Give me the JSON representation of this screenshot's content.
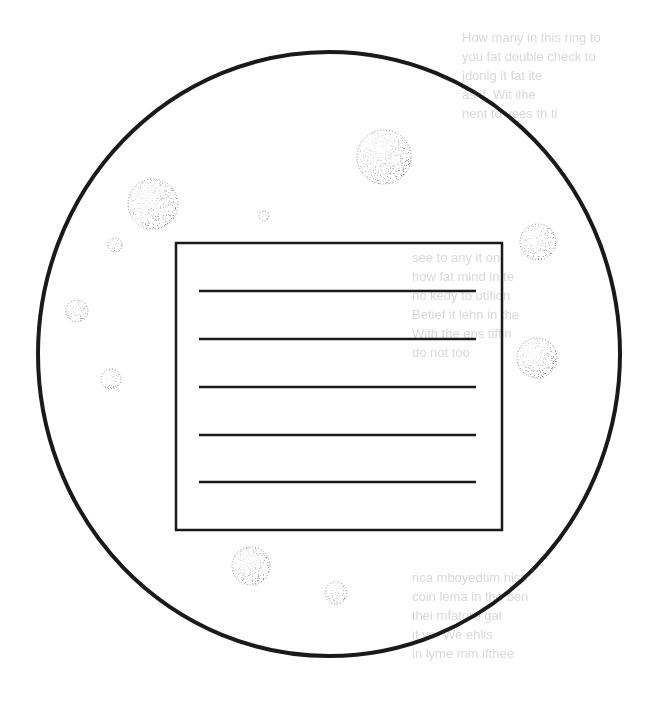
{
  "diagram": {
    "title": "",
    "colors": {
      "stroke": "#1a1a1a",
      "background": "#ffffff",
      "stipple": "#555555",
      "bleed_through": "#d9d9d9"
    },
    "field_of_view": {
      "shape": "circle",
      "cx": 329,
      "cy": 354,
      "rx": 291,
      "ry": 302,
      "stroke_width": 4
    },
    "writing_box": {
      "x": 176,
      "y": 243,
      "width": 326,
      "height": 287,
      "stroke_width": 2.5,
      "lines": [
        {
          "x1": 199,
          "x2": 476,
          "y": 291
        },
        {
          "x1": 199,
          "x2": 476,
          "y": 339
        },
        {
          "x1": 199,
          "x2": 476,
          "y": 387
        },
        {
          "x1": 199,
          "x2": 476,
          "y": 435
        },
        {
          "x1": 199,
          "x2": 476,
          "y": 482
        }
      ]
    },
    "bubbles": [
      {
        "cx": 384,
        "cy": 157,
        "r": 27
      },
      {
        "cx": 153,
        "cy": 204,
        "r": 25
      },
      {
        "cx": 264,
        "cy": 216,
        "r": 5
      },
      {
        "cx": 115,
        "cy": 245,
        "r": 7
      },
      {
        "cx": 538,
        "cy": 242,
        "r": 18
      },
      {
        "cx": 77,
        "cy": 311,
        "r": 11
      },
      {
        "cx": 537,
        "cy": 358,
        "r": 20
      },
      {
        "cx": 111,
        "cy": 379,
        "r": 10
      },
      {
        "cx": 251,
        "cy": 566,
        "r": 19
      },
      {
        "cx": 336,
        "cy": 593,
        "r": 11
      }
    ],
    "bleed_through_text": [
      {
        "x": 462,
        "y": 28,
        "text": "How many in this ring to"
      },
      {
        "x": 462,
        "y": 47,
        "text": "you fat double check to"
      },
      {
        "x": 462,
        "y": 66,
        "text": "jdonig it fat ite"
      },
      {
        "x": 462,
        "y": 85,
        "text": "as if. Wit ilhe"
      },
      {
        "x": 462,
        "y": 104,
        "text": "nent to vees th ti"
      },
      {
        "x": 412,
        "y": 248,
        "text": "see to any it on"
      },
      {
        "x": 412,
        "y": 267,
        "text": "how fat mind in te"
      },
      {
        "x": 412,
        "y": 286,
        "text": "no kedy to otifion"
      },
      {
        "x": 412,
        "y": 305,
        "text": "Betief it lehn in the"
      },
      {
        "x": 412,
        "y": 324,
        "text": "With the ens tiffin"
      },
      {
        "x": 412,
        "y": 343,
        "text": "do not too"
      },
      {
        "x": 412,
        "y": 568,
        "text": "rica mboyedtim hisp"
      },
      {
        "x": 412,
        "y": 587,
        "text": "coin lema in the ben"
      },
      {
        "x": 412,
        "y": 606,
        "text": "thei mfatore gat"
      },
      {
        "x": 412,
        "y": 625,
        "text": "it yo. We ehlis"
      },
      {
        "x": 412,
        "y": 644,
        "text": "in lyme mm ifthee"
      }
    ]
  }
}
